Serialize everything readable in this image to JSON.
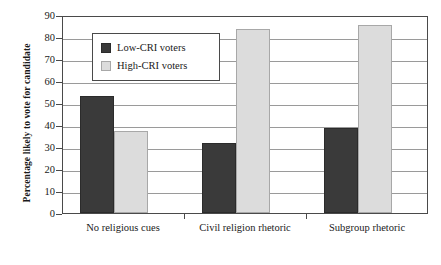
{
  "chart_data": {
    "type": "bar",
    "title": "",
    "subtitle": "",
    "xlabel": "",
    "ylabel": "Percentage likely to vote for candidate",
    "categories": [
      "No religious cues",
      "Civil religion rhetoric",
      "Subgroup rhetoric"
    ],
    "series": [
      {
        "name": "Low-CRI voters",
        "color": "#3a3a3a",
        "values": [
          53,
          32,
          38.5
        ]
      },
      {
        "name": "High-CRI voters",
        "color": "#dcdcdc",
        "values": [
          37.5,
          83.5,
          85.5
        ]
      }
    ],
    "ylim": [
      0,
      90
    ],
    "ytick_step": 10,
    "yticks": [
      0,
      10,
      20,
      30,
      40,
      50,
      60,
      70,
      80,
      90
    ],
    "ytick_labels": [
      "0",
      "10",
      "20",
      "30",
      "40",
      "50",
      "60",
      "70",
      "80",
      "90"
    ],
    "grid": true,
    "grid_axis": "y",
    "legend_position": "upper-left-inside",
    "annotations": []
  },
  "legend": {
    "entries": [
      {
        "label": "Low-CRI voters",
        "swatch": "low"
      },
      {
        "label": "High-CRI voters",
        "swatch": "high"
      }
    ]
  },
  "colors": {
    "low_cri": "#3a3a3a",
    "high_cri": "#dcdcdc",
    "axis": "#4a4a4a",
    "gridline": "#9a9a9a",
    "background": "#ffffff"
  }
}
